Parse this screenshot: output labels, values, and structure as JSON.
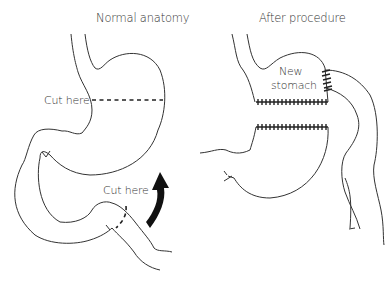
{
  "panels": {
    "left": {
      "title": "Normal anatomy",
      "labels": [
        "Cut here",
        "Cut here"
      ]
    },
    "right": {
      "title": "After procedure",
      "labels": [
        "New",
        "stomach"
      ]
    }
  },
  "colors": {
    "stroke": "#333333",
    "background": "#ffffff",
    "arrow": "#111111"
  }
}
